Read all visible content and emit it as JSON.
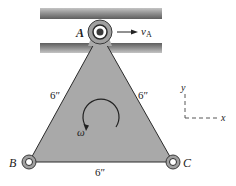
{
  "figure": {
    "points": {
      "A": "A",
      "B": "B",
      "C": "C"
    },
    "velocity_label": "v",
    "velocity_subscript": "A",
    "angular_velocity_label": "ω",
    "dimensions": {
      "left_side": "6″",
      "right_side": "6″",
      "bottom_side": "6″"
    },
    "axes": {
      "x": "x",
      "y": "y"
    },
    "colors": {
      "plate": "#a9a9a9",
      "rail": "#9a9a9a",
      "stroke": "#2a2a2a"
    }
  }
}
